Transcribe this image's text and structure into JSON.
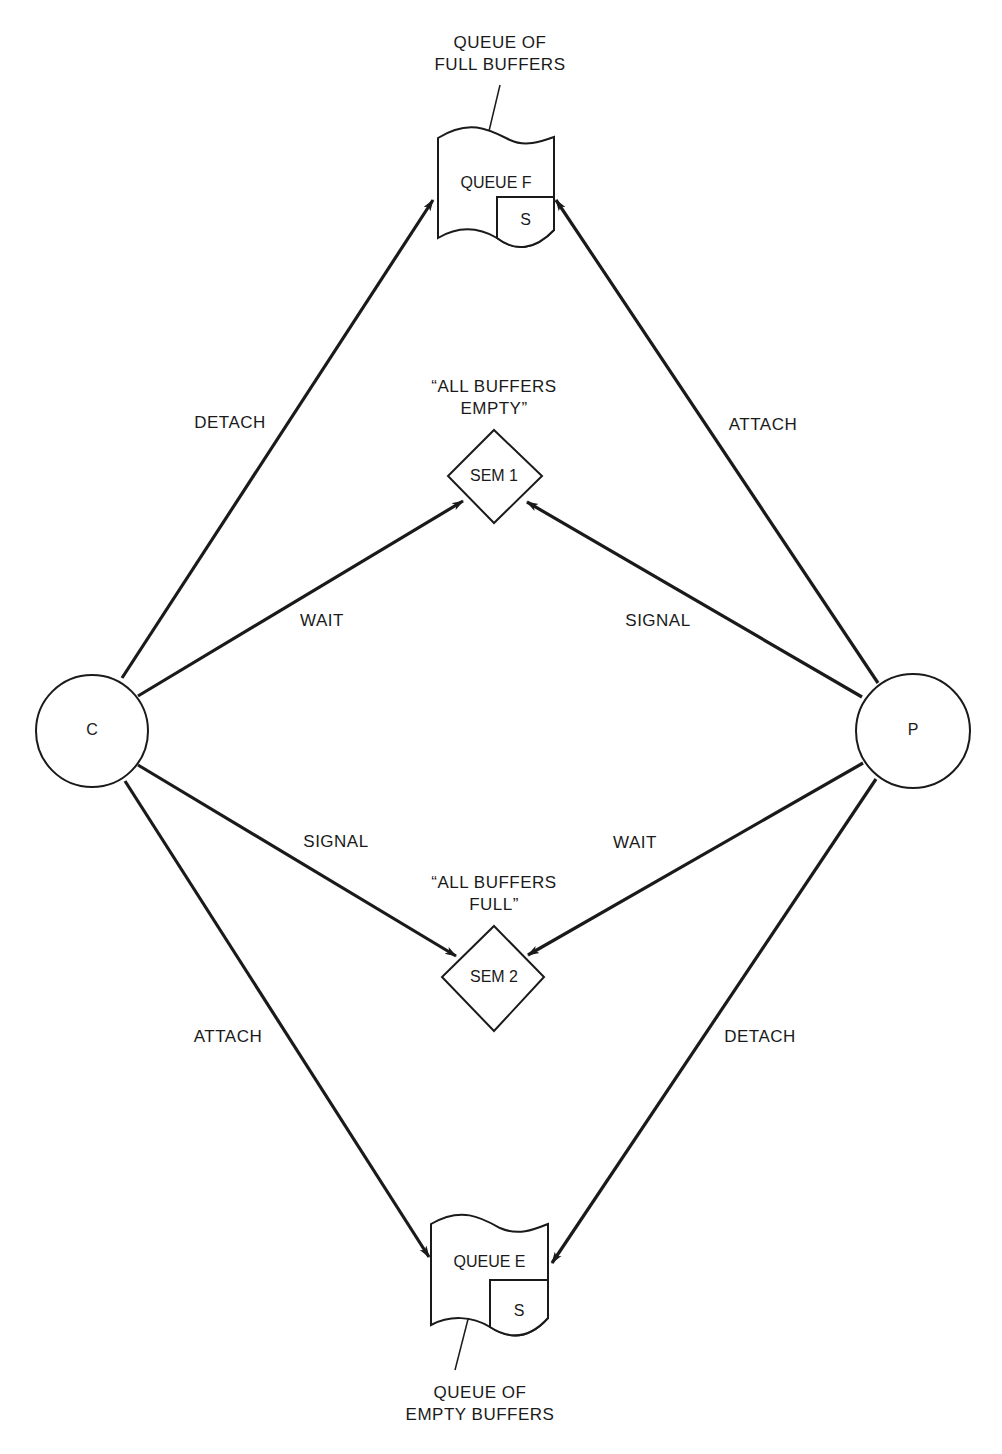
{
  "nodes": {
    "consumer": {
      "label": "C"
    },
    "producer": {
      "label": "P"
    },
    "queue_f": {
      "label": "QUEUE F",
      "sub": "S",
      "caption": "QUEUE OF\nFULL BUFFERS"
    },
    "queue_e": {
      "label": "QUEUE E",
      "sub": "S",
      "caption": "QUEUE OF\nEMPTY BUFFERS"
    },
    "sem1": {
      "label": "SEM 1",
      "caption": "“ALL BUFFERS\nEMPTY”"
    },
    "sem2": {
      "label": "SEM 2",
      "caption": "“ALL BUFFERS\nFULL”"
    }
  },
  "edges": {
    "c_to_queue_f": "DETACH",
    "p_to_queue_f": "ATTACH",
    "c_to_sem1": "WAIT",
    "p_to_sem1": "SIGNAL",
    "c_to_sem2": "SIGNAL",
    "p_to_sem2": "WAIT",
    "c_to_queue_e": "ATTACH",
    "p_to_queue_e": "DETACH"
  }
}
